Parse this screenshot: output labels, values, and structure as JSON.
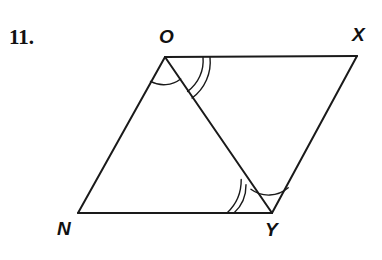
{
  "page": {
    "background_color": "#ffffff",
    "ink_color": "#1a1a1a",
    "width": 382,
    "height": 260
  },
  "problem": {
    "number_label": "11.",
    "figure_type": "parallelogram-with-diagonal"
  },
  "figure": {
    "name": "parallelogram-NOXY-with-diagonal-OY",
    "stroke_color": "#1a1a1a",
    "stroke_width": 2,
    "arc_stroke_width": 1.4,
    "vertices": [
      {
        "id": "O",
        "label": "O",
        "x": 165,
        "y": 57
      },
      {
        "id": "X",
        "label": "X",
        "x": 357,
        "y": 56
      },
      {
        "id": "Y",
        "label": "Y",
        "x": 272,
        "y": 213
      },
      {
        "id": "N",
        "label": "N",
        "x": 78,
        "y": 213
      }
    ],
    "sides": [
      {
        "id": "NO",
        "from": "N",
        "to": "O",
        "d": "M 78 213 L 165 57"
      },
      {
        "id": "OX",
        "from": "O",
        "to": "X",
        "d": "M 165 57 L 357 56"
      },
      {
        "id": "XY",
        "from": "X",
        "to": "Y",
        "d": "M 357 56 L 272 213"
      },
      {
        "id": "YN",
        "from": "Y",
        "to": "N",
        "d": "M 272 213 L 78 213"
      }
    ],
    "diagonal": {
      "id": "OY",
      "from": "O",
      "to": "Y",
      "d": "M 165 57 L 272 213"
    },
    "angle_marks": [
      {
        "id": "angle-NOY",
        "at_vertex": "O",
        "between": [
          "N",
          "Y"
        ],
        "arc_count": 1,
        "congruence_group": "single",
        "arcs": [
          {
            "d": "M 150.5 81.4 A 28 28 0 0 0 180.7 79.0"
          }
        ]
      },
      {
        "id": "angle-YOX",
        "at_vertex": "O",
        "between": [
          "Y",
          "X"
        ],
        "arc_count": 2,
        "congruence_group": "double",
        "arcs": [
          {
            "d": "M 187.6 91.4 A 38 38 0 0 0 203.0 57.2"
          },
          {
            "d": "M 192.1 98.0 A 45 45 0 0 0 210.0 57.2"
          }
        ]
      },
      {
        "id": "angle-NYO",
        "at_vertex": "Y",
        "between": [
          "N",
          "O"
        ],
        "arc_count": 2,
        "congruence_group": "double",
        "arcs": [
          {
            "d": "M 234.0 213.0 A 38 38 0 0 0 246.0 184.7"
          },
          {
            "d": "M 227.0 213.0 A 45 45 0 0 0 241.2 179.5"
          }
        ]
      },
      {
        "id": "angle-OYX",
        "at_vertex": "Y",
        "between": [
          "O",
          "X"
        ],
        "arc_count": 1,
        "congruence_group": "single",
        "arcs": [
          {
            "d": "M 250.9 189.3 A 30 30 0 0 0 288.2 187.8"
          }
        ]
      }
    ]
  },
  "labels": {
    "O": "O",
    "X": "X",
    "N": "N",
    "Y": "Y"
  }
}
